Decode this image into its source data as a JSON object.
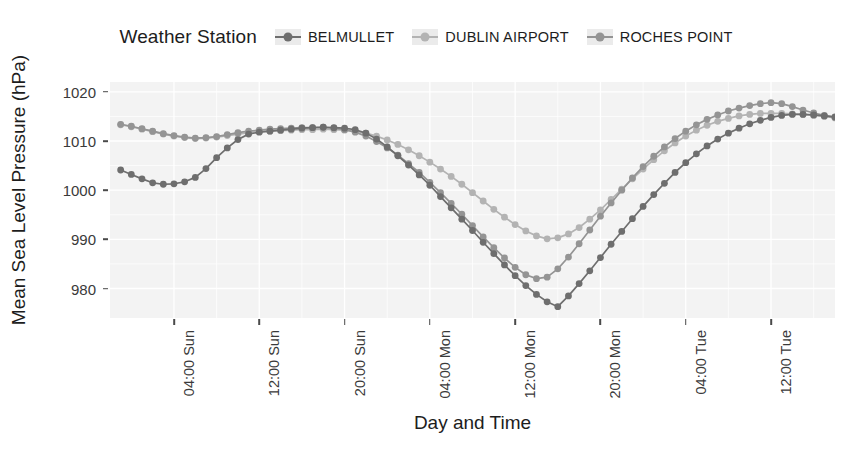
{
  "legend": {
    "title": "Weather Station",
    "entries": [
      {
        "label": "BELMULLET",
        "color": "#6e6e6e"
      },
      {
        "label": "DUBLIN AIRPORT",
        "color": "#b3b3b3"
      },
      {
        "label": "ROCHES POINT",
        "color": "#949494"
      }
    ]
  },
  "axes": {
    "y_title": "Mean Sea Level Pressure (hPa)",
    "x_title": "Day and Time",
    "y_ticks": [
      "980",
      "990",
      "1000",
      "1010",
      "1020"
    ],
    "x_ticks": [
      "04:00 Sun",
      "12:00 Sun",
      "20:00 Sun",
      "04:00 Mon",
      "12:00 Mon",
      "20:00 Mon",
      "04:00 Tue",
      "12:00 Tue",
      "20:00 Tue"
    ]
  },
  "chart_data": {
    "type": "line",
    "title": "",
    "xlabel": "Day and Time",
    "ylabel": "Mean Sea Level Pressure (hPa)",
    "ylim": [
      974,
      1022
    ],
    "xlim": [
      0,
      68
    ],
    "grid": true,
    "legend_position": "top",
    "legend_title": "Weather Station",
    "x_tick_labels": [
      "04:00 Sun",
      "12:00 Sun",
      "20:00 Sun",
      "04:00 Mon",
      "12:00 Mon",
      "20:00 Mon",
      "04:00 Tue",
      "12:00 Tue",
      "20:00 Tue"
    ],
    "x_tick_values": [
      6,
      14,
      22,
      30,
      38,
      46,
      54,
      62,
      70
    ],
    "y_tick_values": [
      980,
      990,
      1000,
      1010,
      1020
    ],
    "x": [
      1,
      2,
      3,
      4,
      5,
      6,
      7,
      8,
      9,
      10,
      11,
      12,
      13,
      14,
      15,
      16,
      17,
      18,
      19,
      20,
      21,
      22,
      23,
      24,
      25,
      26,
      27,
      28,
      29,
      30,
      31,
      32,
      33,
      34,
      35,
      36,
      37,
      38,
      39,
      40,
      41,
      42,
      43,
      44,
      45,
      46,
      47,
      48,
      49,
      50,
      51,
      52,
      53,
      54,
      55,
      56,
      57,
      58,
      59,
      60,
      61,
      62,
      63,
      64,
      65,
      66,
      67,
      68
    ],
    "series": [
      {
        "name": "BELMULLET",
        "color": "#6e6e6e",
        "values": [
          1004.1,
          1003.2,
          1002.3,
          1001.5,
          1001.2,
          1001.3,
          1001.7,
          1002.6,
          1004.4,
          1006.6,
          1008.6,
          1010.3,
          1011.4,
          1011.8,
          1012.0,
          1012.2,
          1012.4,
          1012.6,
          1012.7,
          1012.8,
          1012.7,
          1012.6,
          1012.3,
          1011.6,
          1010.4,
          1008.8,
          1007.0,
          1005.1,
          1003.1,
          1001.0,
          998.7,
          996.4,
          994.1,
          991.8,
          989.4,
          987.1,
          984.8,
          982.6,
          980.6,
          978.8,
          977.3,
          976.3,
          978.5,
          981.0,
          983.6,
          986.3,
          989.0,
          991.6,
          994.2,
          996.7,
          999.1,
          1001.4,
          1003.6,
          1005.6,
          1007.4,
          1009.0,
          1010.4,
          1011.6,
          1012.6,
          1013.5,
          1014.2,
          1014.8,
          1015.2,
          1015.4,
          1015.4,
          1015.3,
          1015.1,
          1014.9
        ]
      },
      {
        "name": "DUBLIN AIRPORT",
        "color": "#b3b3b3",
        "values": [
          1013.3,
          1012.9,
          1012.4,
          1011.9,
          1011.4,
          1011.0,
          1010.7,
          1010.5,
          1010.6,
          1010.8,
          1011.1,
          1011.4,
          1011.7,
          1011.9,
          1012.0,
          1012.1,
          1012.2,
          1012.3,
          1012.3,
          1012.4,
          1012.3,
          1012.2,
          1012.0,
          1011.6,
          1011.0,
          1010.2,
          1009.3,
          1008.2,
          1007.0,
          1005.7,
          1004.3,
          1002.8,
          1001.2,
          999.5,
          997.8,
          996.1,
          994.5,
          993.0,
          991.7,
          990.7,
          990.1,
          990.3,
          991.1,
          992.4,
          994.1,
          996.0,
          998.1,
          1000.2,
          1002.3,
          1004.3,
          1006.2,
          1008.0,
          1009.6,
          1011.0,
          1012.2,
          1013.2,
          1014.0,
          1014.6,
          1015.1,
          1015.4,
          1015.6,
          1015.6,
          1015.6,
          1015.5,
          1015.4,
          1015.2,
          1015.0,
          1014.7
        ]
      },
      {
        "name": "ROCHES POINT",
        "color": "#949494",
        "values": [
          1013.4,
          1013.0,
          1012.5,
          1012.0,
          1011.5,
          1011.1,
          1010.8,
          1010.6,
          1010.7,
          1010.9,
          1011.3,
          1011.7,
          1012.0,
          1012.2,
          1012.4,
          1012.5,
          1012.6,
          1012.7,
          1012.7,
          1012.8,
          1012.6,
          1012.3,
          1011.8,
          1011.0,
          1009.9,
          1008.6,
          1007.1,
          1005.4,
          1003.6,
          1001.6,
          999.5,
          997.3,
          995.1,
          992.8,
          990.5,
          988.3,
          986.2,
          984.3,
          982.8,
          982.0,
          982.3,
          984.0,
          986.4,
          989.1,
          991.9,
          994.7,
          997.4,
          1000.0,
          1002.5,
          1004.8,
          1006.9,
          1008.8,
          1010.5,
          1012.0,
          1013.3,
          1014.4,
          1015.3,
          1016.1,
          1016.7,
          1017.2,
          1017.6,
          1017.8,
          1017.6,
          1017.0,
          1016.3,
          1015.7,
          1015.2,
          1014.8
        ]
      }
    ]
  }
}
